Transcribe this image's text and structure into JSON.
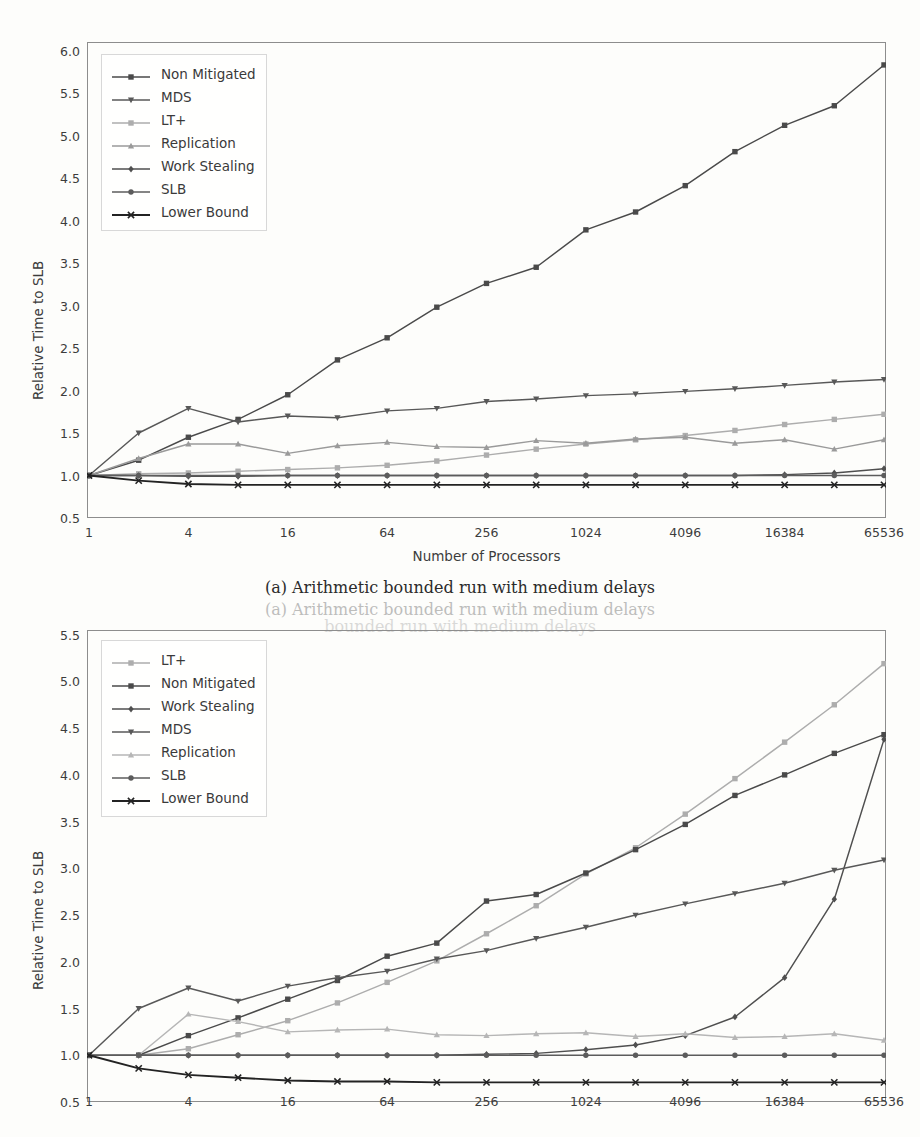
{
  "figure": {
    "caption_a": "(a) Arithmetic bounded run with medium delays",
    "caption_ghost": "(a) Arithmetic bounded run with medium delays",
    "caption_ghost2": "bounded run with medium delays"
  },
  "chart_data": [
    {
      "id": "a",
      "type": "line",
      "title": "(a) Arithmetic bounded run with medium delays",
      "xlabel": "Number of Processors",
      "ylabel": "Relative Time to SLB",
      "xscale": "log2",
      "x": [
        1,
        2,
        4,
        8,
        16,
        32,
        64,
        128,
        256,
        512,
        1024,
        2048,
        4096,
        8192,
        16384,
        32768,
        65536
      ],
      "xtick_labels": [
        "1",
        "4",
        "16",
        "64",
        "256",
        "1024",
        "4096",
        "16384",
        "65536"
      ],
      "xtick_values": [
        1,
        4,
        16,
        64,
        256,
        1024,
        4096,
        16384,
        65536
      ],
      "ytick_labels": [
        "0.5",
        "1.0",
        "1.5",
        "2.0",
        "2.5",
        "3.0",
        "3.5",
        "4.0",
        "4.5",
        "5.0",
        "5.5",
        "6.0"
      ],
      "ylim": [
        0.5,
        6.1
      ],
      "xlim": [
        1,
        65536
      ],
      "grid": false,
      "legend_position": "upper left",
      "series": [
        {
          "name": "Non Mitigated",
          "color": "#4a4a4a",
          "marker": "square",
          "values": [
            1.0,
            1.18,
            1.45,
            1.66,
            1.95,
            2.36,
            2.62,
            2.98,
            3.26,
            3.45,
            3.89,
            4.1,
            4.41,
            4.81,
            5.12,
            5.35,
            5.83
          ]
        },
        {
          "name": "MDS",
          "color": "#585858",
          "marker": "triangle-down",
          "values": [
            1.0,
            1.5,
            1.79,
            1.63,
            1.7,
            1.68,
            1.76,
            1.79,
            1.87,
            1.9,
            1.94,
            1.96,
            1.99,
            2.02,
            2.06,
            2.1,
            2.13
          ]
        },
        {
          "name": "LT+",
          "color": "#adadad",
          "marker": "square",
          "values": [
            1.0,
            1.02,
            1.03,
            1.05,
            1.07,
            1.09,
            1.12,
            1.17,
            1.24,
            1.31,
            1.37,
            1.42,
            1.47,
            1.53,
            1.6,
            1.66,
            1.72
          ]
        },
        {
          "name": "Replication",
          "color": "#9a9a9a",
          "marker": "triangle-up",
          "values": [
            1.0,
            1.2,
            1.37,
            1.37,
            1.26,
            1.35,
            1.39,
            1.34,
            1.33,
            1.41,
            1.38,
            1.43,
            1.45,
            1.38,
            1.42,
            1.31,
            1.42
          ]
        },
        {
          "name": "Work Stealing",
          "color": "#4f4f4f",
          "marker": "diamond",
          "values": [
            1.0,
            1.0,
            0.99,
            0.99,
            1.0,
            1.0,
            1.0,
            1.0,
            1.0,
            1.0,
            1.0,
            1.0,
            1.0,
            1.0,
            1.01,
            1.03,
            1.08
          ]
        },
        {
          "name": "SLB",
          "color": "#5c5c5c",
          "marker": "circle",
          "values": [
            1.0,
            1.0,
            1.0,
            1.0,
            1.0,
            1.0,
            1.0,
            1.0,
            1.0,
            1.0,
            1.0,
            1.0,
            1.0,
            1.0,
            1.0,
            1.0,
            1.0
          ]
        },
        {
          "name": "Lower Bound",
          "color": "#232323",
          "marker": "x",
          "values": [
            1.0,
            0.94,
            0.9,
            0.89,
            0.89,
            0.89,
            0.89,
            0.89,
            0.89,
            0.89,
            0.89,
            0.89,
            0.89,
            0.89,
            0.89,
            0.89,
            0.89
          ]
        }
      ]
    },
    {
      "id": "b",
      "type": "line",
      "xlabel": "Number of Processors",
      "ylabel": "Relative Time to SLB",
      "xscale": "log2",
      "x": [
        1,
        2,
        4,
        8,
        16,
        32,
        64,
        128,
        256,
        512,
        1024,
        2048,
        4096,
        8192,
        16384,
        32768,
        65536
      ],
      "xtick_labels": [
        "1",
        "4",
        "16",
        "64",
        "256",
        "1024",
        "4096",
        "16384",
        "65536"
      ],
      "xtick_values": [
        1,
        4,
        16,
        64,
        256,
        1024,
        4096,
        16384,
        65536
      ],
      "ytick_labels": [
        "0.5",
        "1.0",
        "1.5",
        "2.0",
        "2.5",
        "3.0",
        "3.5",
        "4.0",
        "4.5",
        "5.0",
        "5.5"
      ],
      "ylim": [
        0.5,
        5.55
      ],
      "xlim": [
        1,
        65536
      ],
      "grid": false,
      "legend_position": "upper left",
      "series": [
        {
          "name": "LT+",
          "color": "#adadad",
          "marker": "square",
          "values": [
            1.0,
            1.0,
            1.07,
            1.22,
            1.37,
            1.56,
            1.78,
            2.01,
            2.3,
            2.6,
            2.94,
            3.22,
            3.58,
            3.96,
            4.35,
            4.75,
            5.19
          ]
        },
        {
          "name": "Non Mitigated",
          "color": "#4a4a4a",
          "marker": "square",
          "values": [
            1.0,
            1.0,
            1.21,
            1.4,
            1.6,
            1.8,
            2.06,
            2.2,
            2.65,
            2.72,
            2.95,
            3.2,
            3.47,
            3.78,
            4.0,
            4.23,
            4.43
          ]
        },
        {
          "name": "Work Stealing",
          "color": "#4f4f4f",
          "marker": "diamond",
          "values": [
            1.0,
            1.0,
            1.0,
            1.0,
            1.0,
            1.0,
            1.0,
            1.0,
            1.01,
            1.02,
            1.06,
            1.11,
            1.21,
            1.41,
            1.83,
            2.67,
            4.38
          ]
        },
        {
          "name": "MDS",
          "color": "#585858",
          "marker": "triangle-down",
          "values": [
            1.0,
            1.5,
            1.72,
            1.58,
            1.74,
            1.83,
            1.9,
            2.03,
            2.12,
            2.25,
            2.37,
            2.5,
            2.62,
            2.73,
            2.84,
            2.98,
            3.09
          ]
        },
        {
          "name": "Replication",
          "color": "#b6b6b6",
          "marker": "triangle-up",
          "values": [
            1.0,
            1.0,
            1.44,
            1.36,
            1.25,
            1.27,
            1.28,
            1.22,
            1.21,
            1.23,
            1.24,
            1.2,
            1.23,
            1.19,
            1.2,
            1.23,
            1.16
          ]
        },
        {
          "name": "SLB",
          "color": "#5c5c5c",
          "marker": "circle",
          "values": [
            1.0,
            1.0,
            1.0,
            1.0,
            1.0,
            1.0,
            1.0,
            1.0,
            1.0,
            1.0,
            1.0,
            1.0,
            1.0,
            1.0,
            1.0,
            1.0,
            1.0
          ]
        },
        {
          "name": "Lower Bound",
          "color": "#232323",
          "marker": "x",
          "values": [
            1.0,
            0.86,
            0.79,
            0.76,
            0.73,
            0.72,
            0.72,
            0.71,
            0.71,
            0.71,
            0.71,
            0.71,
            0.71,
            0.71,
            0.71,
            0.71,
            0.71
          ]
        }
      ]
    }
  ]
}
